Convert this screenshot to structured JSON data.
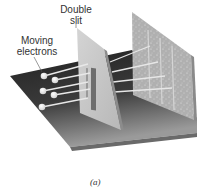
{
  "figure": {
    "labels": {
      "double_slit": "Double slit",
      "moving_electrons": "Moving electrons"
    },
    "caption": "(a)"
  },
  "colors": {
    "base_plate_dark": "#2a2a2a",
    "base_plate_light": "#8a8a8a",
    "slit_panel": "#c8c8c8",
    "screen_panel": "#b4b4b4",
    "electron": "#f2f2f2",
    "trail": "#e8e8e8"
  },
  "electrons": [
    {
      "x": 44,
      "y": 76
    },
    {
      "x": 55,
      "y": 80
    },
    {
      "x": 43,
      "y": 91
    },
    {
      "x": 54,
      "y": 95
    },
    {
      "x": 42,
      "y": 107
    }
  ]
}
